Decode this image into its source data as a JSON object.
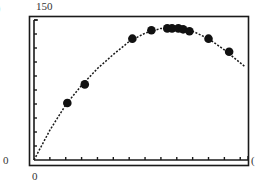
{
  "panel": {
    "label": ")"
  },
  "chart_data": {
    "type": "scatter",
    "title": "",
    "xlabel": "",
    "ylabel": "",
    "x_tick_labels": [
      "0"
    ],
    "y_tick_labels": [
      "0",
      "150"
    ],
    "xlim": [
      0,
      13.3
    ],
    "ylim": [
      0,
      150
    ],
    "x_tick_count": 13,
    "y_tick_count": 10,
    "grid": false,
    "legend": null,
    "series": [
      {
        "name": "data points",
        "kind": "scatter",
        "x": [
          2.1,
          3.2,
          6.2,
          7.4,
          8.4,
          8.7,
          9.1,
          9.4,
          9.8,
          11.0,
          12.3
        ],
        "y": [
          61,
          81,
          130,
          139,
          141,
          141,
          141,
          140,
          138,
          130,
          116
        ]
      },
      {
        "name": "fitted curve",
        "kind": "dotted-line",
        "x": [
          0,
          1,
          2,
          3,
          4,
          5,
          6,
          7,
          8,
          9,
          10,
          11,
          12,
          13.3
        ],
        "y": [
          0,
          32,
          59,
          80,
          98,
          113,
          127,
          136,
          141,
          141,
          138,
          130,
          118,
          100
        ]
      }
    ]
  },
  "labels": {
    "y_max": "150",
    "y_min": "0",
    "x_min": "0",
    "x_max_partial": "("
  },
  "style": {
    "line_color": "#1a1a1a",
    "point_color": "#111111",
    "background": "#ffffff"
  }
}
